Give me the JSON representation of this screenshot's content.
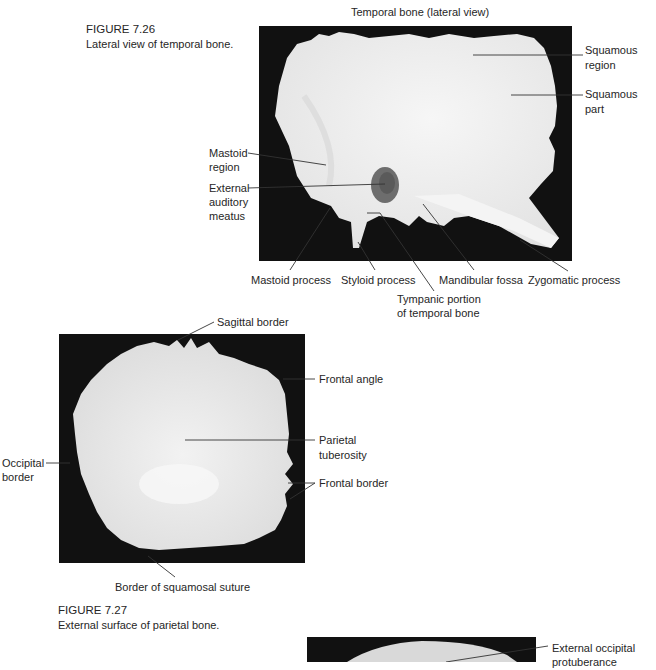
{
  "figure_726": {
    "number": "FIGURE 7.26",
    "caption": "Lateral view of temporal bone.",
    "title": "Temporal bone (lateral view)",
    "labels": {
      "squamous_region": [
        "Squamous",
        "region"
      ],
      "squamous_part": [
        "Squamous",
        "part"
      ],
      "mastoid_region": [
        "Mastoid",
        "region"
      ],
      "external_auditory_meatus": [
        "External",
        "auditory",
        "meatus"
      ],
      "mastoid_process": "Mastoid process",
      "styloid_process": "Styloid process",
      "mandibular_fossa": "Mandibular fossa",
      "zygomatic_process": "Zygomatic process",
      "tympanic_portion": [
        "Tympanic portion",
        "of temporal bone"
      ]
    }
  },
  "figure_727": {
    "number": "FIGURE 7.27",
    "caption": "External surface of parietal bone.",
    "labels": {
      "sagittal_border": "Sagittal border",
      "frontal_angle": "Frontal angle",
      "parietal_tuberosity": [
        "Parietal",
        "tuberosity"
      ],
      "frontal_border": "Frontal border",
      "occipital_border": [
        "Occipital",
        "border"
      ],
      "squamosal_suture_border": "Border of squamosal suture"
    }
  },
  "figure_728_partial": {
    "labels": {
      "external_occipital_protuberance": [
        "External occipital",
        "protuberance"
      ]
    }
  },
  "colors": {
    "background": "#ffffff",
    "photo_background": "#111111",
    "bone": "#ececec",
    "text": "#262626",
    "leader_line": "#333333"
  }
}
